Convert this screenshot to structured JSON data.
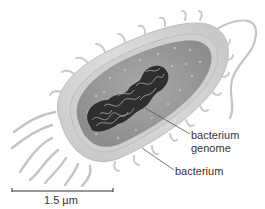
{
  "figure": {
    "labels": {
      "genome_line1": "bacterium",
      "genome_line2": "genome",
      "cell": "bacterium"
    },
    "scale_bar": {
      "label": "1.5 µm"
    },
    "colors": {
      "background": "#ffffff",
      "capsule": "#d9d9d9",
      "capsule_edge": "#bdbdbd",
      "membrane": "#c9c9c9",
      "cytoplasm": "#9e9e9e",
      "cytoplasm_dark": "#8a8a8a",
      "genome": "#2b2b2b",
      "genome_strand": "#bfbfbf",
      "appendage": "#c4c4c4",
      "leader_line": "#555555",
      "text": "#333333"
    }
  }
}
